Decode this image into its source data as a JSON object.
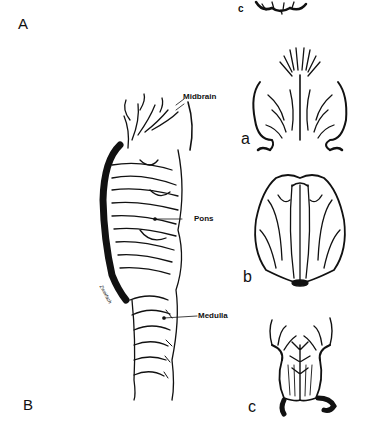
{
  "figure": {
    "panels": {
      "A": "A",
      "B": "B"
    },
    "sublabels": {
      "top_c": "c",
      "a": "a",
      "b": "b",
      "c": "c"
    },
    "brainstem_labels": {
      "midbrain": "Midbrain",
      "pons": "Pons",
      "medulla": "Medulla"
    },
    "signature": "Zweifach",
    "colors": {
      "ink": "#111111",
      "background": "#ffffff"
    }
  }
}
